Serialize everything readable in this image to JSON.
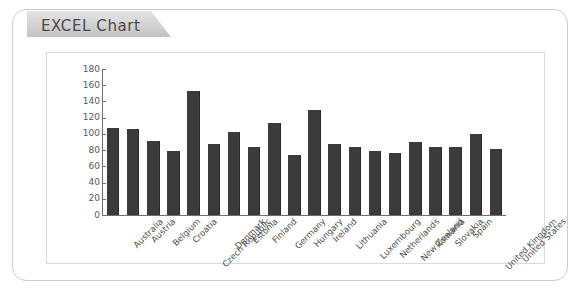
{
  "card": {
    "tab_label": "EXCEL Chart"
  },
  "chart_data": {
    "type": "bar",
    "title": "",
    "subtitle": "",
    "xlabel": "",
    "ylabel": "",
    "ylim": [
      0,
      180
    ],
    "ytick_step": 20,
    "yticks": [
      0,
      20,
      40,
      60,
      80,
      100,
      120,
      140,
      160,
      180
    ],
    "ytick_labels": [
      "0",
      "20",
      "40",
      "60",
      "80",
      "100",
      "120",
      "140",
      "160",
      "180"
    ],
    "grid": false,
    "legend": false,
    "legend_position": "none",
    "bar_color": "#3b3b3b",
    "axis_color": "#6f6f6f",
    "categories": [
      "Australia",
      "Austria",
      "Belgium",
      "Croatia",
      "Czech Republic",
      "Denmark",
      "Estonia",
      "Finland",
      "Germany",
      "Hungary",
      "Ireland",
      "Lithuania",
      "Luxembourg",
      "Netherlands",
      "New Zealand",
      "Romania",
      "Slovakia",
      "Spain",
      "United Kingdom",
      "United States"
    ],
    "values": [
      107,
      106,
      91,
      79,
      153,
      88,
      102,
      84,
      114,
      74,
      129,
      88,
      84,
      79,
      77,
      90,
      84,
      84,
      100,
      82
    ]
  }
}
